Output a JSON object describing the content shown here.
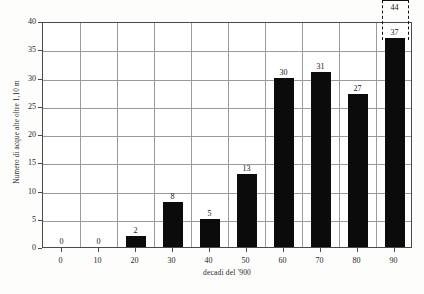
{
  "chart_data": {
    "type": "bar",
    "title": "",
    "subtitle": "",
    "xlabel": "decadi del '900",
    "ylabel": "Numero di acque alte oltre 1,10 m",
    "categories": [
      "0",
      "10",
      "20",
      "30",
      "40",
      "50",
      "60",
      "70",
      "80",
      "90"
    ],
    "values": [
      0,
      0,
      2,
      8,
      5,
      13,
      30,
      31,
      27,
      37
    ],
    "value_labels": [
      "0",
      "0",
      "2",
      "8",
      "5",
      "13",
      "30",
      "31",
      "27",
      "37"
    ],
    "ylim": [
      0,
      40
    ],
    "ytick_values": [
      0,
      5,
      10,
      15,
      20,
      25,
      30,
      35,
      40
    ],
    "ytick_labels": [
      "0",
      "5",
      "10",
      "15",
      "20",
      "25",
      "30",
      "35",
      "40"
    ],
    "grid": "both",
    "legend": "none",
    "bar_color": "#0b0b0b",
    "grid_color": "#9a9a9a",
    "axis_color": "#4a4a4a",
    "annotations": [
      {
        "name": "projection-90s",
        "category": "90",
        "actual_value": 37,
        "actual_label": "37",
        "projected_value": 44,
        "projected_label": "44",
        "style": "dashed-bracket"
      }
    ]
  }
}
